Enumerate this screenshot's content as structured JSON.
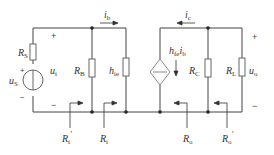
{
  "diagram": {
    "colors": {
      "wire": "#444444",
      "component": "#666666",
      "text": "#333333"
    },
    "labels": {
      "rs": {
        "main": "R",
        "sub": "S"
      },
      "us": {
        "main": "u",
        "sub": "S"
      },
      "ui": {
        "main": "u",
        "sub": "i"
      },
      "rb": {
        "main": "R",
        "sub": "B"
      },
      "hie": {
        "main": "h",
        "sub": "ie"
      },
      "ib": {
        "main": "i",
        "sub": "b"
      },
      "ic": {
        "main": "i",
        "sub": "c"
      },
      "hfe_ib": {
        "main": "h",
        "sub": "fe",
        "main2": "i",
        "sub2": "b"
      },
      "rc": {
        "main": "R",
        "sub": "C"
      },
      "rl": {
        "main": "R",
        "sub": "L"
      },
      "uo": {
        "main": "u",
        "sub": "o"
      },
      "ri_prime": {
        "main": "R",
        "sub": "i",
        "prime": "′"
      },
      "ri": {
        "main": "R",
        "sub": "i"
      },
      "ro": {
        "main": "R",
        "sub": "o"
      },
      "ro_prime": {
        "main": "R",
        "sub": "o",
        "prime": "′"
      }
    },
    "signs": {
      "ui_plus": "+",
      "ui_minus": "−",
      "us_plus": "+",
      "us_minus": "−",
      "uo_plus": "+",
      "uo_minus": "−"
    }
  }
}
